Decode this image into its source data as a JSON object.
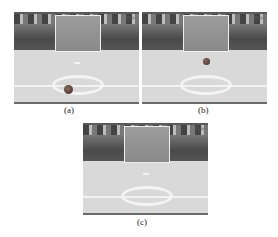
{
  "figure": {
    "panels": [
      {
        "label": "(a)",
        "overlay_text": "15 fps",
        "ball": "near center circle, bottom"
      },
      {
        "label": "(b)",
        "overlay_text": "15 fps",
        "ball": "midfield, above center circle"
      },
      {
        "label": "(c)",
        "overlay_text": "15 fps",
        "ball": "not visible"
      }
    ]
  }
}
